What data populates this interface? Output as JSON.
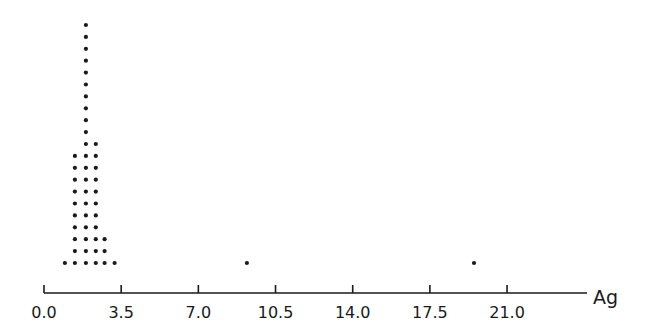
{
  "chart_data": {
    "type": "scatter",
    "subtype": "dot-plot",
    "title": "",
    "xlabel": "Ag",
    "ylabel": "",
    "xlim": [
      0.0,
      24.5
    ],
    "x_ticks": [
      0.0,
      3.5,
      7.0,
      10.5,
      14.0,
      17.5,
      21.0
    ],
    "x_tick_labels": [
      "0.0",
      "3.5",
      "7.0",
      "10.5",
      "14.0",
      "17.5",
      "21.0"
    ],
    "grid": false,
    "legend": null,
    "stacks": [
      {
        "x": 0.95,
        "count": 1
      },
      {
        "x": 1.4,
        "count": 10
      },
      {
        "x": 1.9,
        "count": 21
      },
      {
        "x": 2.35,
        "count": 11
      },
      {
        "x": 2.75,
        "count": 3
      },
      {
        "x": 3.2,
        "count": 1
      },
      {
        "x": 9.2,
        "count": 1
      },
      {
        "x": 19.5,
        "count": 1
      }
    ],
    "total_points": 49
  },
  "colors": {
    "dot": "#1a1a1a",
    "axis": "#1a1a1a",
    "background": "#ffffff"
  }
}
